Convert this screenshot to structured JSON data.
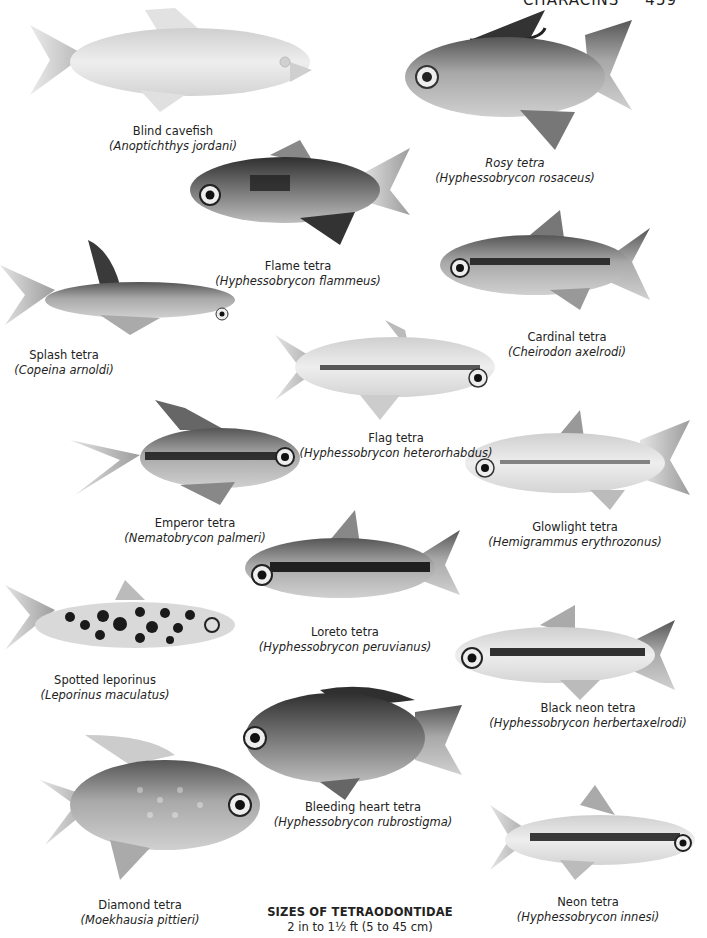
{
  "header": {
    "section": "CHARACINS",
    "page": "459"
  },
  "species": [
    {
      "id": "blind-cavefish",
      "common": "Blind cavefish",
      "latin": "(Anoptichthys jordani)"
    },
    {
      "id": "rosy-tetra",
      "common": "Rosy tetra",
      "latin": "(Hyphessobrycon rosaceus)",
      "common_italic": true
    },
    {
      "id": "flame-tetra",
      "common": "Flame tetra",
      "latin": "(Hyphessobrycon flammeus)"
    },
    {
      "id": "splash-tetra",
      "common": "Splash tetra",
      "latin": "(Copeina arnoldi)"
    },
    {
      "id": "cardinal-tetra",
      "common": "Cardinal tetra",
      "latin": "(Cheirodon axelrodi)"
    },
    {
      "id": "flag-tetra",
      "common": "Flag tetra",
      "latin": "(Hyphessobrycon heterorhabdus)"
    },
    {
      "id": "emperor-tetra",
      "common": "Emperor tetra",
      "latin": "(Nematobrycon palmeri)"
    },
    {
      "id": "glowlight-tetra",
      "common": "Glowlight tetra",
      "latin": "(Hemigrammus erythrozonus)"
    },
    {
      "id": "loreto-tetra",
      "common": "Loreto tetra",
      "latin": "(Hyphessobrycon peruvianus)"
    },
    {
      "id": "spotted-leporinus",
      "common": "Spotted leporinus",
      "latin": "(Leporinus maculatus)"
    },
    {
      "id": "black-neon-tetra",
      "common": "Black neon tetra",
      "latin": "(Hyphessobrycon herbertaxelrodi)"
    },
    {
      "id": "bleeding-heart-tetra",
      "common": "Bleeding heart tetra",
      "latin": "(Hyphessobrycon rubrostigma)"
    },
    {
      "id": "diamond-tetra",
      "common": "Diamond tetra",
      "latin": "(Moekhausia pittieri)"
    },
    {
      "id": "neon-tetra",
      "common": "Neon tetra",
      "latin": "(Hyphessobrycon innesi)"
    }
  ],
  "footer": {
    "title": "SIZES OF TETRAODONTIDAE",
    "range": "2 in to 1½ ft (5 to 45 cm)"
  },
  "colors": {
    "ink": "#222222",
    "fish_light": "#d8d8d8",
    "fish_mid": "#9a9a9a",
    "fish_dark": "#2a2a2a",
    "paper": "#ffffff"
  }
}
